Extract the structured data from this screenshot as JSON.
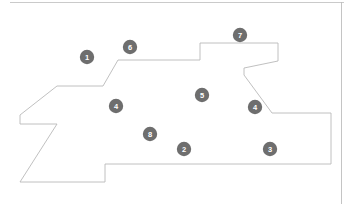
{
  "figure": {
    "name": "parcel-outline-map",
    "background_color": "#ffffff",
    "outline_color": "#b9b9b9",
    "outline_width": 0.9,
    "fill_color": "#ffffff",
    "marker_fill": "#6e6e6e",
    "marker_text_color": "#ffffff",
    "marker_radius": 7.2,
    "border_line_color": "#bdbdbd"
  },
  "shape": {
    "name": "parcel-boundary",
    "points": "118,60 200,60 200,43 278,43 278,61 244,68 244,75 272,113 331,113 331,164 105,164 105,182 20,182 57,124 20,124 20,115 57,86 103,86"
  },
  "borders": {
    "top_rule": {
      "x1": 10,
      "y1": 2.5,
      "x2": 344,
      "y2": 2.5
    },
    "right_rule": {
      "x1": 341.5,
      "y1": 2,
      "x2": 341.5,
      "y2": 204
    }
  },
  "markers": [
    {
      "id": "marker-1",
      "label": "1",
      "cx": 87,
      "cy": 57
    },
    {
      "id": "marker-6",
      "label": "6",
      "cx": 130,
      "cy": 47
    },
    {
      "id": "marker-7",
      "label": "7",
      "cx": 240,
      "cy": 35
    },
    {
      "id": "marker-4a",
      "label": "4",
      "cx": 116,
      "cy": 106
    },
    {
      "id": "marker-5",
      "label": "5",
      "cx": 202,
      "cy": 95
    },
    {
      "id": "marker-4b",
      "label": "4",
      "cx": 255,
      "cy": 107
    },
    {
      "id": "marker-8",
      "label": "8",
      "cx": 150,
      "cy": 134
    },
    {
      "id": "marker-2",
      "label": "2",
      "cx": 184,
      "cy": 149
    },
    {
      "id": "marker-3",
      "label": "3",
      "cx": 270,
      "cy": 149
    }
  ]
}
